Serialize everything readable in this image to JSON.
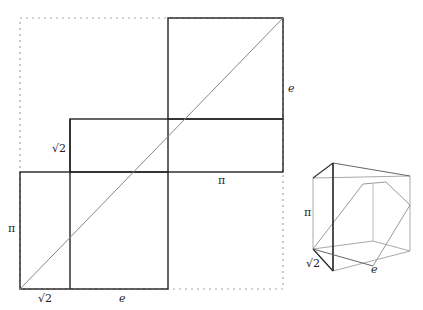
{
  "diagram": {
    "colors": {
      "edge": "#222222",
      "diagonal": "#888888",
      "dotted": "#aaaaaa",
      "cube_light": "#aaaaaa"
    },
    "net": {
      "labels": {
        "top_square_right": "e",
        "middle_left": "√2",
        "middle_bottom": "π",
        "bottom_left": "π",
        "bottom_sqrt2": "√2",
        "bottom_e": "e"
      }
    },
    "box": {
      "labels": {
        "height": "π",
        "depth": "√2",
        "width": "e"
      }
    }
  }
}
